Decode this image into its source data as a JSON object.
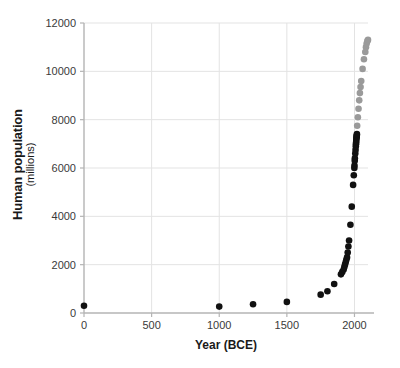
{
  "chart_data": {
    "type": "scatter",
    "title": "",
    "xlabel": "Year (BCE)",
    "ylabel": "Human population",
    "ylabel_sub": "(millions)",
    "xlim": [
      0,
      2100
    ],
    "ylim": [
      0,
      12000
    ],
    "xticks": [
      0,
      500,
      1000,
      1500,
      2000
    ],
    "xtick_labels": [
      "0",
      "500",
      "1000",
      "1500",
      "2000"
    ],
    "yticks": [
      0,
      2000,
      4000,
      6000,
      8000,
      10000,
      12000
    ],
    "ytick_labels": [
      "0",
      "2000",
      "4000",
      "6000",
      "8000",
      "10000",
      "12000"
    ],
    "grid": true,
    "legend": "none",
    "series": [
      {
        "name": "historical",
        "color": "#111111",
        "marker": "circle",
        "points": [
          [
            0,
            300
          ],
          [
            1000,
            265
          ],
          [
            1250,
            360
          ],
          [
            1500,
            460
          ],
          [
            1750,
            760
          ],
          [
            1800,
            900
          ],
          [
            1850,
            1200
          ],
          [
            1900,
            1600
          ],
          [
            1910,
            1700
          ],
          [
            1920,
            1800
          ],
          [
            1925,
            1900
          ],
          [
            1930,
            2000
          ],
          [
            1935,
            2100
          ],
          [
            1940,
            2200
          ],
          [
            1945,
            2300
          ],
          [
            1950,
            2500
          ],
          [
            1955,
            2750
          ],
          [
            1960,
            3000
          ],
          [
            1970,
            3650
          ],
          [
            1980,
            4400
          ],
          [
            1990,
            5300
          ],
          [
            1995,
            5700
          ],
          [
            1999,
            6000
          ],
          [
            2000,
            6100
          ],
          [
            2002,
            6300
          ],
          [
            2003,
            6400
          ],
          [
            2006,
            6600
          ],
          [
            2008,
            6750
          ],
          [
            2010,
            6900
          ],
          [
            2011,
            6980
          ],
          [
            2012,
            7050
          ],
          [
            2013,
            7120
          ],
          [
            2014,
            7200
          ],
          [
            2015,
            7250
          ],
          [
            2016,
            7300
          ],
          [
            2017,
            7350
          ],
          [
            2018,
            7400
          ]
        ]
      },
      {
        "name": "projection",
        "color": "#9a9a9a",
        "marker": "circle",
        "points": [
          [
            2020,
            7750
          ],
          [
            2025,
            8100
          ],
          [
            2030,
            8450
          ],
          [
            2035,
            8800
          ],
          [
            2040,
            9100
          ],
          [
            2045,
            9350
          ],
          [
            2050,
            9600
          ],
          [
            2060,
            10100
          ],
          [
            2070,
            10500
          ],
          [
            2080,
            10800
          ],
          [
            2085,
            11000
          ],
          [
            2090,
            11150
          ],
          [
            2095,
            11250
          ],
          [
            2100,
            11300
          ]
        ]
      }
    ]
  }
}
